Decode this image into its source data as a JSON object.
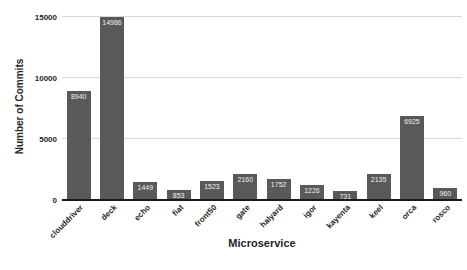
{
  "chart_data": {
    "type": "bar",
    "categories": [
      "clouddriver",
      "deck",
      "echo",
      "fiat",
      "front50",
      "gate",
      "halyard",
      "igor",
      "kayenta",
      "keel",
      "orca",
      "rosco"
    ],
    "values": [
      8940,
      14986,
      1449,
      853,
      1523,
      2160,
      1752,
      1226,
      731,
      2135,
      6925,
      960
    ],
    "title": "",
    "xlabel": "Microservice",
    "ylabel": "Number of Commits",
    "ylim": [
      0,
      15000
    ],
    "yticks": [
      0,
      5000,
      10000,
      15000
    ],
    "grid": true,
    "legend": "none",
    "bar_color": "#595959",
    "value_label_color": "#f0f0f0",
    "gridline_color": "#d9d9d9",
    "axis_line_color": "#1a1a1a",
    "text_color": "#262626"
  }
}
